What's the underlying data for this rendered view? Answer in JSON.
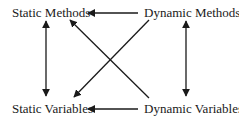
{
  "diagram": {
    "nodes": [
      {
        "id": "static_methods",
        "label": "Static Methods"
      },
      {
        "id": "dynamic_methods",
        "label": "Dynamic Methods"
      },
      {
        "id": "static_variables",
        "label": "Static Variables"
      },
      {
        "id": "dynamic_variables",
        "label": "Dynamic Variables"
      }
    ],
    "edges": [
      {
        "from": "dynamic_methods",
        "to": "static_methods",
        "direction": "one-way"
      },
      {
        "from": "dynamic_variables",
        "to": "static_variables",
        "direction": "one-way"
      },
      {
        "from": "static_methods",
        "to": "static_variables",
        "direction": "two-way"
      },
      {
        "from": "dynamic_methods",
        "to": "dynamic_variables",
        "direction": "two-way"
      },
      {
        "from": "dynamic_methods",
        "to": "static_variables",
        "direction": "one-way"
      },
      {
        "from": "dynamic_variables",
        "to": "static_methods",
        "direction": "one-way"
      }
    ],
    "colors": {
      "line": "#1a1a1a",
      "text": "#1a1a1a",
      "background": "#ffffff"
    }
  }
}
